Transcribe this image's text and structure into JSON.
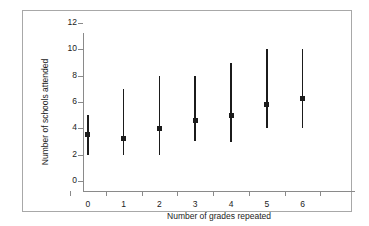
{
  "chart_data": {
    "type": "scatter",
    "title": "",
    "xlabel": "Number of grades repeated",
    "ylabel": "Number of schools attended",
    "categories": [
      "0",
      "1",
      "2",
      "3",
      "4",
      "5",
      "6"
    ],
    "x": [
      0,
      1,
      2,
      3,
      4,
      5,
      6
    ],
    "values": [
      3.5,
      3.25,
      4.0,
      4.6,
      5.0,
      5.8,
      6.25
    ],
    "range_low": [
      2,
      2,
      2,
      3,
      3,
      4,
      4
    ],
    "range_high": [
      5,
      7,
      8,
      8,
      9,
      10,
      10
    ],
    "ylim": [
      0,
      12
    ],
    "ytick_labels": [
      "0",
      "2",
      "4",
      "6",
      "8",
      "10",
      "12"
    ],
    "ytick_values": [
      0,
      2,
      4,
      6,
      8,
      10,
      12
    ],
    "grid": false,
    "legend": null,
    "series": [
      {
        "name": "Mean number of schools attended",
        "values": [
          3.5,
          3.25,
          4.0,
          4.6,
          5.0,
          5.8,
          6.25
        ],
        "range_low": [
          2,
          2,
          2,
          3,
          3,
          4,
          4
        ],
        "range_high": [
          5,
          7,
          8,
          8,
          9,
          10,
          10
        ]
      }
    ],
    "marker_color": "#1b1b1b",
    "line_color": "#1b1b1b",
    "axis_color": "#8a8a8a",
    "frame_color": "#a8a8a8",
    "background": "#ffffff"
  }
}
